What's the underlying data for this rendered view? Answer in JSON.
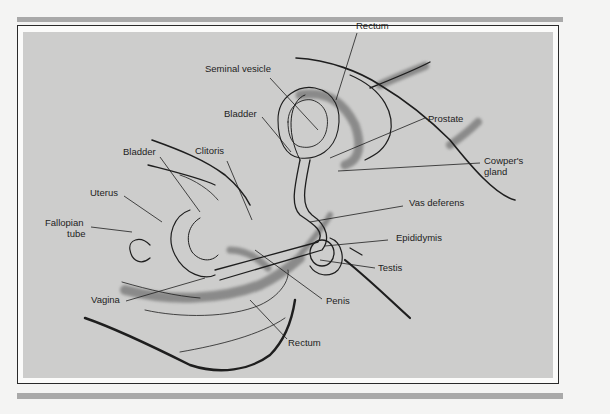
{
  "figure": {
    "colors": {
      "page_background": "#f4f4f3",
      "rule_bar": "#a9a9a9",
      "frame_border": "#2a2a2a",
      "panel_background": "#cdcdcc",
      "ink": "#1d1d1d"
    }
  },
  "labels": {
    "rectum_top": "Rectum",
    "seminal_vesicle": "Seminal vesicle",
    "bladder_male": "Bladder",
    "prostate": "Prostate",
    "bladder_female": "Bladder",
    "clitoris": "Clitoris",
    "cowpers_gland_line1": "Cowper's",
    "cowpers_gland_line2": "gland",
    "uterus": "Uterus",
    "vas_deferens": "Vas deferens",
    "fallopian_tube_line1": "Fallopian",
    "fallopian_tube_line2": "tube",
    "epididymis": "Epididymis",
    "testis": "Testis",
    "vagina": "Vagina",
    "penis": "Penis",
    "rectum_bottom": "Rectum"
  }
}
